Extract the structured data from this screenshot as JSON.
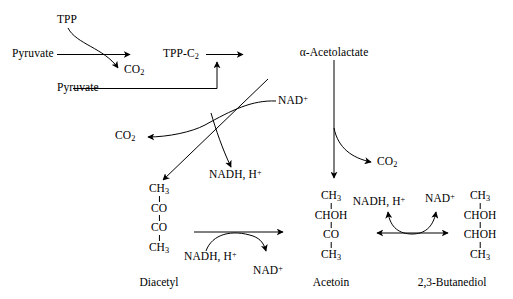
{
  "diagram": {
    "ink_color": "#000000",
    "background_color": "#ffffff"
  },
  "labels": {
    "tpp": "TPP",
    "pyruvate_1": "Pyruvate",
    "pyruvate_2": "Pyruvate",
    "co2_1": "CO",
    "co2_1_sub": "2",
    "tpp_c2": "TPP-C",
    "tpp_c2_sub": "2",
    "acetolactate": "α-Acetolactate",
    "nad_plus_1": "NAD",
    "nad_plus_1_sup": "+",
    "co2_2": "CO",
    "co2_2_sub": "2",
    "co2_3": "CO",
    "co2_3_sub": "2",
    "nadh_h_1": "NADH, H",
    "nadh_h_1_sup": "+",
    "nadh_h_2": "NADH, H",
    "nadh_h_2_sup": "+",
    "nad_plus_2": "NAD",
    "nad_plus_2_sup": "+",
    "nadh_h_3": "NADH, H",
    "nadh_h_3_sup": "+",
    "nad_plus_3": "NAD",
    "nad_plus_3_sup": "+"
  },
  "molecules": {
    "diacetyl": {
      "caption": "Diacetyl",
      "atoms": [
        "CH",
        "CO",
        "CO",
        "CH"
      ],
      "subs": [
        "3",
        "",
        "",
        "3"
      ]
    },
    "acetoin": {
      "caption": "Acetoin",
      "atoms": [
        "CH",
        "CHOH",
        "CO",
        "CH"
      ],
      "subs": [
        "3",
        "",
        "",
        "3"
      ]
    },
    "butanediol": {
      "caption": "2,3-Butanediol",
      "atoms": [
        "CH",
        "CHOH",
        "CHOH",
        "CH"
      ],
      "subs": [
        "3",
        "",
        "",
        "3"
      ]
    }
  }
}
